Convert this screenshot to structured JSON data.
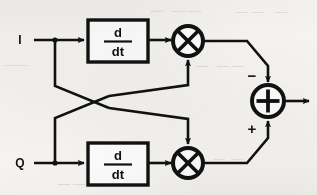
{
  "diagram": {
    "type": "signal-flow-block-diagram",
    "background_color": "#f7f6f3",
    "ink_color": "#111111",
    "inputs": [
      {
        "id": "i",
        "label": "I",
        "x": 20,
        "y": 40
      },
      {
        "id": "q",
        "label": "Q",
        "x": 20,
        "y": 163
      }
    ],
    "blocks": [
      {
        "id": "deriv-top",
        "kind": "derivative",
        "numerator": "d",
        "denominator": "dt",
        "x": 88,
        "y": 20,
        "w": 60,
        "h": 42
      },
      {
        "id": "deriv-bottom",
        "kind": "derivative",
        "numerator": "d",
        "denominator": "dt",
        "x": 88,
        "y": 143,
        "w": 60,
        "h": 42
      }
    ],
    "multipliers": [
      {
        "id": "mult-top",
        "glyph": "x-cross",
        "cx": 188,
        "cy": 41,
        "r": 15
      },
      {
        "id": "mult-bottom",
        "glyph": "x-cross",
        "cx": 188,
        "cy": 163,
        "r": 15
      }
    ],
    "summer": {
      "id": "summing-junction",
      "glyph": "plus",
      "cx": 268,
      "cy": 101,
      "r": 16,
      "signs": [
        {
          "id": "sign-minus",
          "symbol": "−",
          "port": "top",
          "x": 250,
          "y": 80
        },
        {
          "id": "sign-plus",
          "symbol": "+",
          "port": "bottom",
          "x": 250,
          "y": 130
        }
      ]
    },
    "output": {
      "id": "output-arrow",
      "x": 284,
      "y": 101,
      "x2": 312
    },
    "notes": {
      "crossover": "I tap feeds bottom multiplier; Q tap feeds top multiplier",
      "top_product_sign": "−",
      "bottom_product_sign": "+"
    },
    "ghost_text": {
      "top_left": "— ——",
      "top_right": "—— —",
      "mid_left": "——",
      "mid_right": "— ——",
      "bottom_left": "—— —",
      "bottom_right": "— —"
    }
  }
}
